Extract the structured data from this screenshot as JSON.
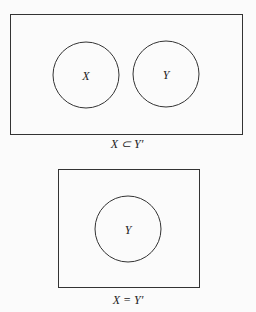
{
  "diagrams": [
    {
      "circles": [
        {
          "label": "X"
        },
        {
          "label": "Y"
        }
      ],
      "caption": "X ⊂ Y′"
    },
    {
      "circles": [
        {
          "label": "Y"
        }
      ],
      "caption": "X = Y′"
    }
  ],
  "colors": {
    "stroke": "#333333",
    "background": "#fbfbfb"
  }
}
